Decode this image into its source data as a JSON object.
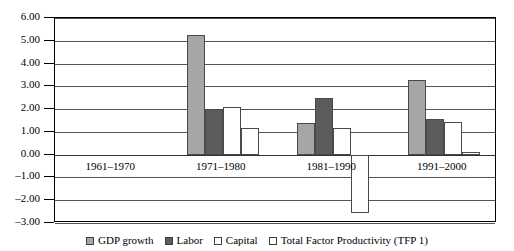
{
  "chart_data": {
    "type": "bar",
    "title": "",
    "xlabel": "",
    "ylabel": "",
    "ylim": [
      -3.0,
      6.0
    ],
    "ytick_step": 1.0,
    "grid": true,
    "legend_position": "bottom",
    "categories": [
      "1961–1970",
      "1971–1980",
      "1981–1990",
      "1991–2000"
    ],
    "ytick_labels": [
      "6.00",
      "5.00",
      "4.00",
      "3.00",
      "2.00",
      "1.00",
      "0.00",
      "–1.00",
      "–2.00",
      "–3.00"
    ],
    "ytick_values": [
      6,
      5,
      4,
      3,
      2,
      1,
      0,
      -1,
      -2,
      -3
    ],
    "series": [
      {
        "name": "GDP growth",
        "color": "#a6a6a6",
        "values": [
          null,
          5.25,
          1.4,
          3.26
        ]
      },
      {
        "name": "Labor",
        "color": "#5c5c5c",
        "values": [
          null,
          2.0,
          2.48,
          1.57
        ]
      },
      {
        "name": "Capital",
        "color": "#ffffff",
        "values": [
          null,
          2.1,
          1.15,
          1.45
        ]
      },
      {
        "name": "Total Factor Productivity (TFP 1)",
        "color": "#ffffff",
        "values": [
          null,
          1.15,
          -2.57,
          0.1
        ]
      }
    ]
  },
  "legend": {
    "items": [
      {
        "label": "GDP growth"
      },
      {
        "label": "Labor"
      },
      {
        "label": "Capital"
      },
      {
        "label": "Total Factor Productivity (TFP 1)"
      }
    ]
  }
}
